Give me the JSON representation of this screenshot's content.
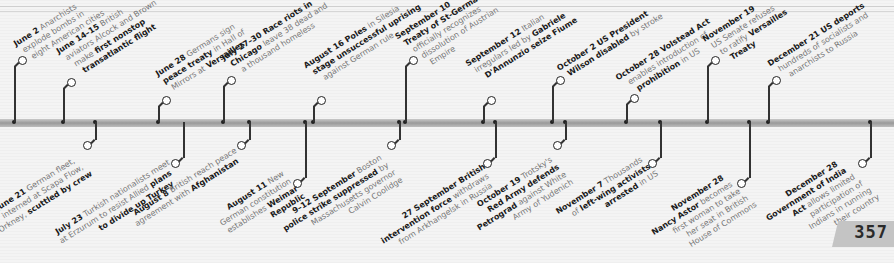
{
  "page_number": "357",
  "top_events": [
    {
      "date": "June 2",
      "lines": [
        [
          "June 2",
          " Anarchists"
        ],
        [
          "",
          "explode bombs in"
        ],
        [
          "",
          "eight American cities"
        ]
      ]
    },
    {
      "date": "June 14–15",
      "lines": [
        [
          "June 14–15",
          " British"
        ],
        [
          "",
          "aviators Alcock and Brown"
        ],
        [
          "",
          "make "
        ],
        [
          "first nonstop",
          ""
        ],
        [
          "transatlantic flight",
          ""
        ]
      ]
    },
    {
      "date": "June 28",
      "lines": [
        [
          "June 28",
          " Germans sign"
        ],
        [
          "peace treaty",
          " in Hall of"
        ],
        [
          "",
          "Mirrors at "
        ],
        [
          "Versailles",
          ""
        ]
      ]
    },
    {
      "date": "July 27–30",
      "lines": [
        [
          "July 27–30 Race riots in",
          ""
        ],
        [
          "Chicago",
          " leave 38 dead and"
        ],
        [
          "",
          "a thousand homeless"
        ]
      ]
    },
    {
      "date": "August 16",
      "lines": [
        [
          "August 16 Poles",
          " in Silesia"
        ],
        [
          "stage unsuccessful uprising",
          ""
        ],
        [
          "",
          "against German rule"
        ]
      ]
    },
    {
      "date": "September 10",
      "lines": [
        [
          "September 10",
          ""
        ],
        [
          "Treaty of St-Germain",
          ""
        ],
        [
          "",
          "officially recognizes"
        ],
        [
          "",
          "dissolution of Austrian"
        ],
        [
          "",
          "Empire"
        ]
      ]
    },
    {
      "date": "September 12",
      "lines": [
        [
          "September 12",
          " Italian"
        ],
        [
          "",
          "irregulars led by "
        ],
        [
          "Gabriele",
          ""
        ],
        [
          "D'Annunzio seize Fiume",
          ""
        ]
      ]
    },
    {
      "date": "October 2",
      "lines": [
        [
          "October 2 US President",
          ""
        ],
        [
          "Wilson disabled",
          " by stroke"
        ]
      ]
    },
    {
      "date": "October 28",
      "lines": [
        [
          "October 28 Volstead Act",
          ""
        ],
        [
          "",
          "enables introduction of"
        ],
        [
          "prohibition",
          " in US"
        ]
      ]
    },
    {
      "date": "November 19",
      "lines": [
        [
          "November 19",
          ""
        ],
        [
          "",
          "US Senate refuses"
        ],
        [
          "",
          "to ratify "
        ],
        [
          "Versailles",
          ""
        ],
        [
          "Treaty",
          ""
        ]
      ]
    },
    {
      "date": "December 21",
      "lines": [
        [
          "December 21 US deports",
          ""
        ],
        [
          "",
          "hundreds of socialists and"
        ],
        [
          "",
          "anarchists to Russia"
        ]
      ]
    }
  ],
  "bottom_events": [
    {
      "date": "June 21",
      "lines": [
        [
          "June 21",
          " German fleet,"
        ],
        [
          "",
          "interned at Scapa Flow,"
        ],
        [
          "",
          "Orkney, "
        ],
        [
          "scuttled by crew",
          ""
        ]
      ]
    },
    {
      "date": "July 23",
      "lines": [
        [
          "July 23",
          " Turkish nationalists meet"
        ],
        [
          "",
          "at Erzurum to resist Allied "
        ],
        [
          "plans",
          ""
        ],
        [
          "to divide up Turkey",
          ""
        ]
      ]
    },
    {
      "date": "August 8",
      "lines": [
        [
          "August 8",
          " British reach peace"
        ],
        [
          "",
          "agreement with "
        ],
        [
          "Afghanistan",
          ""
        ]
      ]
    },
    {
      "date": "August 11",
      "lines": [
        [
          "August 11",
          " New"
        ],
        [
          "",
          "German constitution"
        ],
        [
          "",
          "establishes "
        ],
        [
          "Weimar",
          ""
        ],
        [
          "Republic",
          ""
        ]
      ]
    },
    {
      "date": "9–12 September",
      "lines": [
        [
          "9–12 September",
          " Boston"
        ],
        [
          "police strike suppressed",
          " by"
        ],
        [
          "",
          "Massachusetts governor"
        ],
        [
          "",
          "Calvin Coolidge"
        ]
      ]
    },
    {
      "date": "27 September",
      "lines": [
        [
          "27 September British",
          ""
        ],
        [
          "intervention force",
          " withdraws"
        ],
        [
          "",
          "from Arkhangelsk in Russia"
        ]
      ]
    },
    {
      "date": "October 19",
      "lines": [
        [
          "October 19",
          " Trotsky's"
        ],
        [
          "Red Army defends",
          ""
        ],
        [
          "Petrograd",
          " against White"
        ],
        [
          "",
          "Army of Yudenich"
        ]
      ]
    },
    {
      "date": "November 7",
      "lines": [
        [
          "November 7",
          " Thousands"
        ],
        [
          "",
          "of "
        ],
        [
          "left-wing activists",
          ""
        ],
        [
          "arrested",
          " in US"
        ]
      ]
    },
    {
      "date": "November 28",
      "lines": [
        [
          "November 28",
          ""
        ],
        [
          "Nancy Astor",
          " becomes"
        ],
        [
          "",
          "first woman to take"
        ],
        [
          "",
          "her seat in British"
        ],
        [
          "",
          "House of Commons"
        ]
      ]
    },
    {
      "date": "December 28",
      "lines": [
        [
          "December 28",
          ""
        ],
        [
          "Government of India",
          ""
        ],
        [
          "Act",
          " allows limited"
        ],
        [
          "",
          "participation of"
        ],
        [
          "",
          "Indians in running"
        ],
        [
          "",
          "their country"
        ]
      ]
    }
  ],
  "top_text": {
    "e0": {
      "b1": "June 2",
      "t1": " Anarchists",
      "t2": "explode bombs in",
      "t3": "eight American cities"
    },
    "e1": {
      "b1": "June 14–15",
      "t1": " British",
      "t2": "aviators Alcock and Brown",
      "t3": "make ",
      "b3": "first nonstop",
      "b4": "transatlantic flight"
    },
    "e2": {
      "b1": "June 28",
      "t1": " Germans sign",
      "b2": "peace treaty",
      "t2": " in Hall of",
      "t3": "Mirrors at ",
      "b3": "Versailles"
    },
    "e3": {
      "b1": "July 27–30 Race riots in",
      "b2": "Chicago",
      "t2": " leave 38 dead and",
      "t3": "a thousand homeless"
    },
    "e4": {
      "b1": "August 16 Poles",
      "t1": " in Silesia",
      "b2": "stage unsuccessful uprising",
      "t3": "against German rule"
    },
    "e5": {
      "b1": "September 10",
      "b2": "Treaty of St-Germain",
      "t3": "officially recognizes",
      "t4": "dissolution of Austrian",
      "t5": "Empire"
    },
    "e6": {
      "b1": "September 12",
      "t1": " Italian",
      "t2": "irregulars led by ",
      "b2": "Gabriele",
      "b3": "D'Annunzio seize Fiume"
    },
    "e7": {
      "b1": "October 2 US President",
      "b2": "Wilson disabled",
      "t2": " by stroke"
    },
    "e8": {
      "b1": "October 28 Volstead Act",
      "t2": "enables introduction of",
      "b3": "prohibition",
      "t3": " in US"
    },
    "e9": {
      "b1": "November 19",
      "t2": "US Senate refuses",
      "t3": "to ratify ",
      "b3": "Versailles",
      "b4": "Treaty"
    },
    "e10": {
      "b1": "December 21 US deports",
      "t2": "hundreds of socialists and",
      "t3": "anarchists to Russia"
    }
  },
  "bottom_text": {
    "e0": {
      "b1": "June 21",
      "t1": " German fleet,",
      "t2": "interned at Scapa Flow,",
      "t3": "Orkney, ",
      "b3": "scuttled by crew"
    },
    "e1": {
      "b1": "July 23",
      "t1": " Turkish nationalists meet",
      "t2": "at Erzurum to resist Allied ",
      "b2": "plans",
      "b3": "to divide up Turkey"
    },
    "e2": {
      "b1": "August 8",
      "t1": " British reach peace",
      "t2": "agreement with ",
      "b2": "Afghanistan"
    },
    "e3": {
      "b1": "August 11",
      "t1": " New",
      "t2": "German constitution",
      "t3": "establishes ",
      "b3": "Weimar",
      "b4": "Republic"
    },
    "e4": {
      "b1": "9–12 September",
      "t1": " Boston",
      "b2": "police strike suppressed",
      "t2": " by",
      "t3": "Massachusetts governor",
      "t4": "Calvin Coolidge"
    },
    "e5": {
      "b1": "27 September British",
      "b2": "intervention force",
      "t2": " withdraws",
      "t3": "from Arkhangelsk in Russia"
    },
    "e6": {
      "b1": "October 19",
      "t1": " Trotsky's",
      "b2": "Red Army defends",
      "b3": "Petrograd",
      "t3": " against White",
      "t4": "Army of Yudenich"
    },
    "e7": {
      "b1": "November 7",
      "t1": " Thousands",
      "t2": "of ",
      "b2": "left-wing activists",
      "b3": "arrested",
      "t3": " in US"
    },
    "e8": {
      "b1": "November 28",
      "b2": "Nancy Astor",
      "t2": " becomes",
      "t3": "first woman to take",
      "t4": "her seat in British",
      "t5": "House of Commons"
    },
    "e9": {
      "b1": "December 28",
      "b2": "Government of India",
      "b3": "Act",
      "t3": " allows limited",
      "t4": "participation of",
      "t5": "Indians in running",
      "t6": "their country"
    }
  },
  "colors": {
    "bar": "#a8a8a8",
    "connector": "#222222",
    "bold_text": "#1a1a1a",
    "body_text": "#777777",
    "page_tab": "#c4c4c4"
  }
}
